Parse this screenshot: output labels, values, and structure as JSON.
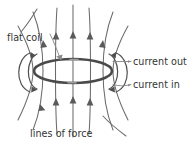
{
  "figure": {
    "background_color": "#ffffff",
    "width": 187,
    "height": 146
  },
  "colors": {
    "coil_stroke": "#4a4a4a",
    "field_line_stroke": "#6b6b6b",
    "leader_stroke": "#8a8a8a",
    "text": "#333333"
  },
  "labels": {
    "flat_coil": "flat coil",
    "current_out": "current out",
    "current_in": "current in",
    "lines_of_force": "lines of force"
  },
  "diagram": {
    "coil": {
      "shape": "ellipse",
      "cx": 73,
      "cy": 71,
      "rx": 39,
      "ry": 12,
      "stroke_width": 2.6
    },
    "field_lines": {
      "count": 9,
      "direction": "upward through coil centre",
      "arrow_direction": "up"
    },
    "side_loops": {
      "left": "return flux loop around left coil edge",
      "right": "return flux loop around right coil edge"
    }
  }
}
